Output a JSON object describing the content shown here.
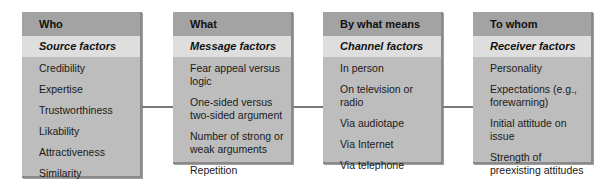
{
  "diagram": {
    "columns": [
      {
        "header": "Who",
        "subheader": "Source factors",
        "items": [
          "Credibility",
          "Expertise",
          "Trustworthiness",
          "Likability",
          "Attractiveness",
          "Similarity"
        ]
      },
      {
        "header": "What",
        "subheader": "Message factors",
        "items": [
          "Fear appeal versus logic",
          "One-sided versus two-sided argument",
          "Number of strong or weak arguments",
          "Repetition"
        ]
      },
      {
        "header": "By what means",
        "subheader": "Channel factors",
        "items": [
          "In person",
          "On television or radio",
          "Via audiotape",
          "Via Internet",
          "Via telephone"
        ]
      },
      {
        "header": "To whom",
        "subheader": "Receiver factors",
        "items": [
          "Personality",
          "Expectations (e.g., forewarning)",
          "Initial attitude on issue",
          "Strength of preexisting attitudes"
        ]
      }
    ],
    "colors": {
      "box_fill": "#bdbdbd",
      "header_fill": "#a3a3a3",
      "subheader_fill": "#dedede",
      "arrow": "#7a7a7a"
    }
  }
}
